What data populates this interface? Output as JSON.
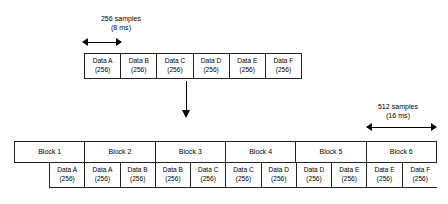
{
  "diagram": {
    "top_caption": {
      "line1": "256 samples",
      "line2": "(8 ms)"
    },
    "bottom_caption": {
      "line1": "512 samples",
      "line2": "(16 ms)"
    },
    "top_table": {
      "cells": [
        {
          "name": "Data A",
          "count": "(256)"
        },
        {
          "name": "Data B",
          "count": "(256)"
        },
        {
          "name": "Data C",
          "count": "(256)"
        },
        {
          "name": "Data D",
          "count": "(256)"
        },
        {
          "name": "Data E",
          "count": "(256)"
        },
        {
          "name": "Data F",
          "count": "(256)"
        }
      ]
    },
    "block_row": {
      "blocks": [
        {
          "label": "Block 1"
        },
        {
          "label": "Block 2"
        },
        {
          "label": "Block 3"
        },
        {
          "label": "Block 4"
        },
        {
          "label": "Block 5"
        },
        {
          "label": "Block 6"
        }
      ]
    },
    "bottom_data_row": {
      "cells": [
        {
          "name": "Data A",
          "count": "(256)"
        },
        {
          "name": "Data A",
          "count": "(256)"
        },
        {
          "name": "Data B",
          "count": "(256)"
        },
        {
          "name": "Data B",
          "count": "(256)"
        },
        {
          "name": "Data C",
          "count": "(256)"
        },
        {
          "name": "Data C",
          "count": "(256)"
        },
        {
          "name": "Data D",
          "count": "(256)"
        },
        {
          "name": "Data D",
          "count": "(256)"
        },
        {
          "name": "Data E",
          "count": "(256)"
        },
        {
          "name": "Data E",
          "count": "(256)"
        },
        {
          "name": "Data F",
          "count": "(256)"
        }
      ]
    },
    "colors": {
      "line": "#222222",
      "arrow": "#000000",
      "background": "#ffffff",
      "text": "#000000"
    }
  }
}
